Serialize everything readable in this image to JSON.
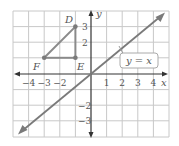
{
  "diagram": {
    "type": "coordinate-plane",
    "x_range": [
      -5,
      5
    ],
    "y_range": [
      -4,
      4
    ],
    "axis_labels": {
      "x": "x",
      "y": "y"
    },
    "x_tick_labels": [
      "−4",
      "−3",
      "−2",
      "1",
      "2",
      "3",
      "4"
    ],
    "y_tick_labels": [
      "3",
      "2",
      "−2",
      "−3"
    ],
    "line": {
      "equation_label": "y = x",
      "color": "#7a7a7a"
    },
    "triangle": {
      "color": "#8a8a8a",
      "points": [
        {
          "name": "D",
          "x": -1,
          "y": 3
        },
        {
          "name": "E",
          "x": -1,
          "y": 1
        },
        {
          "name": "F",
          "x": -3,
          "y": 1
        }
      ]
    },
    "colors": {
      "grid": "#c8c8c8",
      "axis": "#333333",
      "text": "#555555"
    }
  }
}
